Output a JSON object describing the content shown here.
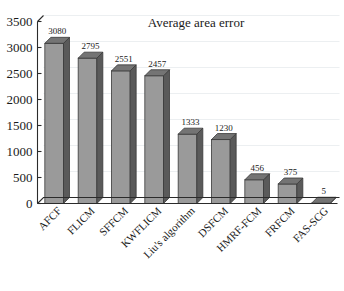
{
  "chart_data": {
    "type": "bar",
    "title": "Average area error",
    "xlabel": "",
    "ylabel": "",
    "categories": [
      "AFCF",
      "FLICM",
      "SFFCM",
      "KWFLICM",
      "Liu's algorithm",
      "DSFCM",
      "HMRF-FCM",
      "FRFCM",
      "FAS-SCG"
    ],
    "values": [
      3080,
      2795,
      2551,
      2457,
      1333,
      1230,
      456,
      375,
      5
    ],
    "value_labels": [
      "3080",
      "2795",
      "2551",
      "2457",
      "1333",
      "1230",
      "456",
      "375",
      "5"
    ],
    "ylim": [
      0,
      3500
    ],
    "yticks": [
      0,
      500,
      1000,
      1500,
      2000,
      2500,
      3000,
      3500
    ],
    "ytick_labels": [
      "0",
      "500",
      "1000",
      "1500",
      "2000",
      "2500",
      "3000",
      "3500"
    ],
    "grid": true,
    "legend": false,
    "style": "3d-column",
    "colors": {
      "bar_front": "#9a9a9a",
      "bar_side": "#5a5a5a",
      "bar_top": "#747474",
      "bar_edge": "#3a3a3a",
      "gridline": "#eceff1",
      "axis": "#2b2b2b",
      "text": "#1a1a1a",
      "background": "#ffffff"
    }
  }
}
